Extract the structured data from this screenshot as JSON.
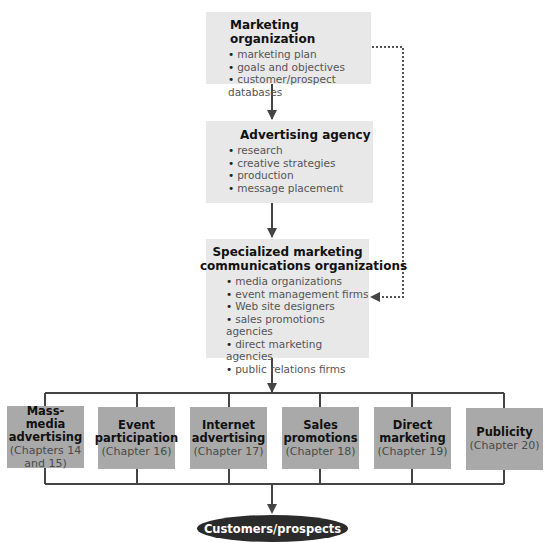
{
  "colors": {
    "top_box_fill": "#e8e8e8",
    "channel_box_fill": "#a9a9a9",
    "line": "#444444",
    "oval_fill": "#2b2b2b",
    "oval_text": "#ffffff"
  },
  "marketing_org": {
    "title": "Marketing organization",
    "items": [
      "marketing plan",
      "goals and objectives",
      "customer/prospect databases"
    ]
  },
  "ad_agency": {
    "title": "Advertising agency",
    "items": [
      "research",
      "creative strategies",
      "production",
      "message placement"
    ]
  },
  "specialized": {
    "title_line1": "Specialized marketing",
    "title_line2": "communications organizations",
    "items": [
      "media organizations",
      "event management firms",
      "Web site designers",
      "sales promotions agencies",
      "direct marketing agencies",
      "public relations firms"
    ]
  },
  "channels": [
    {
      "name": "Mass-media advertising",
      "chapter": "(Chapters 14 and 15)"
    },
    {
      "name": "Event participation",
      "chapter": "(Chapter 16)"
    },
    {
      "name": "Internet advertising",
      "chapter": "(Chapter 17)"
    },
    {
      "name": "Sales promotions",
      "chapter": "(Chapter 18)"
    },
    {
      "name": "Direct marketing",
      "chapter": "(Chapter 19)"
    },
    {
      "name": "Publicity",
      "chapter": "(Chapter 20)"
    }
  ],
  "endpoint": {
    "label": "Customers/prospects"
  }
}
